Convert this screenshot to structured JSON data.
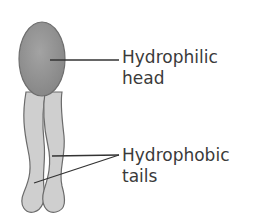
{
  "diagram": {
    "labels": {
      "head": {
        "line1": "Hydrophilic",
        "line2": "head"
      },
      "tails": {
        "line1": "Hydrophobic",
        "line2": "tails"
      }
    },
    "colors": {
      "head_fill": "#8f8f8f",
      "tail_fill": "#cfcfcf",
      "outline": "#6b6b6b",
      "leader_line": "#333333",
      "text": "#3a3a3a"
    }
  }
}
